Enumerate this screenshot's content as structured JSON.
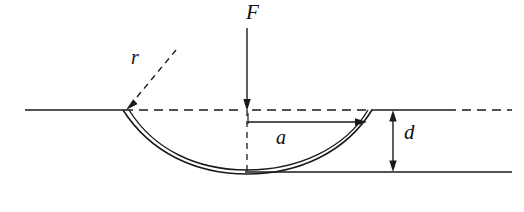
{
  "figure": {
    "type": "engineering-diagram",
    "background_color": "#ffffff",
    "line_color": "#1a1a1a",
    "width": 524,
    "height": 212
  },
  "labels": {
    "force": "F",
    "radius": "r",
    "half_width": "a",
    "depth": "d"
  },
  "annotations": {
    "force_arrow": {
      "name": "force-arrow",
      "direction": "down",
      "x": 247,
      "y_start": 28,
      "y_end": 110
    },
    "radius_leader": {
      "name": "radius-leader-line",
      "style": "dashed",
      "from_x": 174,
      "from_y": 52,
      "to_x": 126,
      "to_y": 109
    },
    "half_width_arrow": {
      "name": "half-width-arrow",
      "direction": "right",
      "y": 122,
      "x_start": 247,
      "x_end": 366
    },
    "depth_arrow": {
      "name": "depth-arrow",
      "direction": "both",
      "x": 393,
      "y_top": 110,
      "y_bottom": 172
    }
  },
  "geometry": {
    "reference_line_y": 110,
    "bottom_line_y": 172,
    "dimple_center_x": 247,
    "dimple_left_x": 123,
    "dimple_right_x": 372,
    "sheet_thickness": 4,
    "left_surface": {
      "x_start": 25,
      "x_end": 123,
      "style": "solid"
    },
    "left_dashed": {
      "x_start": 123,
      "x_end": 243,
      "style": "dashed"
    },
    "right_dashed": {
      "x_start": 251,
      "x_end": 370,
      "style": "dashed"
    },
    "right_surface": {
      "x_start": 370,
      "x_end": 447,
      "style": "solid"
    },
    "far_right_dashed": {
      "x_start": 447,
      "x_end": 512,
      "style": "dashed"
    },
    "bottom_line": {
      "x_start": 245,
      "x_end": 512,
      "style": "solid"
    },
    "center_dashed_vertical": {
      "x": 247,
      "y_start": 110,
      "y_end": 174
    }
  }
}
